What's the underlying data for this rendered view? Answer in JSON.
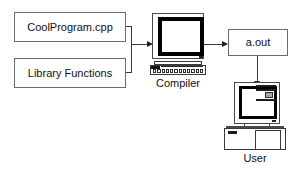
{
  "diagram": {
    "nodes": {
      "source_file": {
        "label": "CoolProgram.cpp",
        "name": "source-file-box"
      },
      "library": {
        "label": "Library Functions",
        "name": "library-functions-box"
      },
      "executable": {
        "label": "a.out",
        "name": "executable-box"
      },
      "compiler": {
        "label": "Compiler",
        "name": "compiler-computer"
      },
      "user": {
        "label": "User",
        "name": "user-computer"
      }
    },
    "edges": [
      {
        "from": "CoolProgram.cpp",
        "to": "Compiler",
        "style": "arrow"
      },
      {
        "from": "Library Functions",
        "to": "Compiler",
        "style": "arrow"
      },
      {
        "from": "Compiler",
        "to": "a.out",
        "style": "arrow"
      },
      {
        "from": "a.out",
        "to": "User",
        "style": "arrow"
      }
    ],
    "colors": {
      "background": "#ffffff",
      "box_border": "#6b6b6b",
      "line": "#3a3a3a",
      "arrowhead": "#202020",
      "text": "#101010",
      "screen_bezel": "#000000",
      "screen_fill": "#ffffff"
    }
  }
}
